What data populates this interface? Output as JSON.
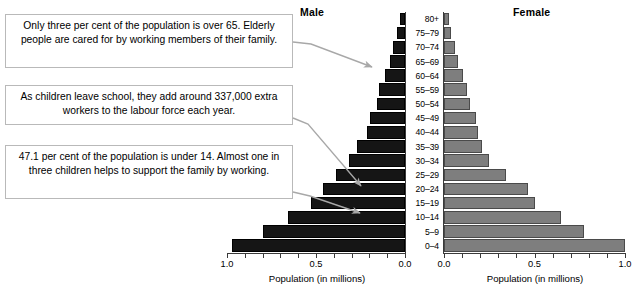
{
  "figure": {
    "panels": {
      "male": {
        "heading": "Male",
        "axis_caption": "Population (in millions)",
        "ticklabels": [
          "1.0",
          "0.5",
          "0.0"
        ]
      },
      "female": {
        "heading": "Female",
        "axis_caption": "Population (in millions)",
        "ticklabels": [
          "0.0",
          "0.5",
          "1.0"
        ]
      }
    },
    "callouts": [
      {
        "text": "Only three per cent of the population is over 65. Elderly people are cared for by working members of their family."
      },
      {
        "text": "As children leave school, they add around 337,000 extra workers to the labour force each year."
      },
      {
        "text": "47.1 per cent of the population is under 14. Almost one in three children helps to support the family by working."
      }
    ],
    "colors": {
      "male_bar": "#151515",
      "female_bar": "#7e7e7e",
      "axis": "#3a3a3a",
      "callout_border": "#b9b9b9"
    }
  },
  "chart_data": {
    "type": "bar",
    "subtype": "population-pyramid",
    "xlabel": "Population (in millions)",
    "ylabel": "Age group",
    "xlim": [
      0.0,
      1.0
    ],
    "grid": false,
    "legend": "panel-headings",
    "categories": [
      "80+",
      "75–79",
      "70–74",
      "65–69",
      "60–64",
      "55–59",
      "50–54",
      "45–49",
      "40–44",
      "35–39",
      "30–34",
      "25–29",
      "20–24",
      "15–19",
      "10–14",
      "5–9",
      "0–4"
    ],
    "series": [
      {
        "name": "Male",
        "direction": "left",
        "values": [
          0.03,
          0.045,
          0.065,
          0.085,
          0.115,
          0.145,
          0.16,
          0.195,
          0.215,
          0.27,
          0.315,
          0.39,
          0.46,
          0.53,
          0.66,
          0.8,
          0.97
        ]
      },
      {
        "name": "Female",
        "direction": "right",
        "values": [
          0.025,
          0.04,
          0.06,
          0.08,
          0.105,
          0.125,
          0.145,
          0.175,
          0.19,
          0.21,
          0.25,
          0.345,
          0.465,
          0.505,
          0.645,
          0.775,
          1.0
        ]
      }
    ]
  },
  "ticks": {
    "values": [
      0.0,
      0.5,
      1.0
    ],
    "minor_step": 0.1
  }
}
